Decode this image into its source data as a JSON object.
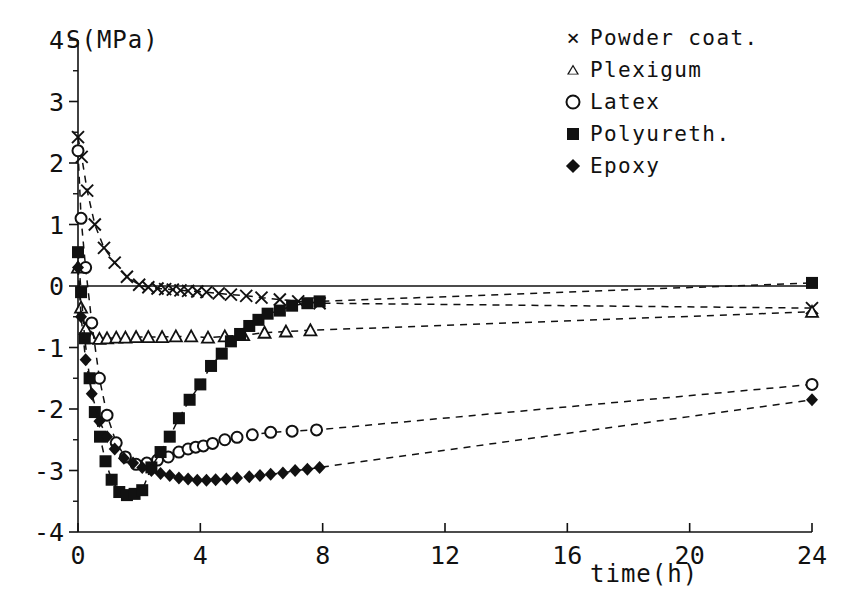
{
  "chart_data": {
    "type": "scatter",
    "title": "",
    "xlabel": "time(h)",
    "ylabel": "S(MPa)",
    "xlim": [
      0,
      24
    ],
    "ylim": [
      -4,
      4
    ],
    "xticks": [
      0,
      4,
      8,
      12,
      16,
      20,
      24
    ],
    "yticks": [
      -4,
      -3,
      -2,
      -1,
      0,
      1,
      2,
      3,
      4
    ],
    "xtick_labels": [
      "0",
      "4",
      "8",
      "12",
      "16",
      "20",
      "24"
    ],
    "ytick_labels": [
      "-4",
      "-3",
      "-2",
      "-1",
      "0",
      "1",
      "2",
      "3",
      "4"
    ],
    "grid": false,
    "legend_position": "top-right",
    "minor_ticks_y": 0.5,
    "line_style": "dashed",
    "series": [
      {
        "name": "Powder coat.",
        "marker": "x",
        "color": "#111111",
        "x": [
          0.0,
          0.12,
          0.3,
          0.55,
          0.85,
          1.2,
          1.6,
          2.0,
          2.3,
          2.6,
          2.85,
          3.1,
          3.35,
          3.6,
          3.9,
          4.2,
          4.6,
          5.0,
          5.5,
          6.0,
          6.6,
          7.2,
          7.9,
          24.0
        ],
        "y": [
          2.42,
          2.1,
          1.55,
          1.0,
          0.62,
          0.38,
          0.15,
          0.02,
          -0.02,
          -0.04,
          -0.05,
          -0.06,
          -0.07,
          -0.08,
          -0.09,
          -0.1,
          -0.12,
          -0.14,
          -0.16,
          -0.19,
          -0.22,
          -0.25,
          -0.28,
          -0.36
        ]
      },
      {
        "name": "Plexigum",
        "marker": "triangle",
        "color": "#111111",
        "x": [
          0.0,
          0.1,
          0.25,
          0.45,
          0.7,
          0.95,
          1.25,
          1.55,
          1.9,
          2.3,
          2.75,
          3.2,
          3.7,
          4.25,
          4.8,
          5.4,
          6.1,
          6.8,
          7.6,
          24.0
        ],
        "y": [
          0.3,
          -0.35,
          -0.7,
          -0.85,
          -0.86,
          -0.85,
          -0.84,
          -0.84,
          -0.83,
          -0.83,
          -0.83,
          -0.82,
          -0.82,
          -0.84,
          -0.82,
          -0.8,
          -0.76,
          -0.74,
          -0.72,
          -0.42
        ]
      },
      {
        "name": "Latex",
        "marker": "circle",
        "color": "#111111",
        "x": [
          0.0,
          0.1,
          0.25,
          0.45,
          0.7,
          0.95,
          1.25,
          1.55,
          1.9,
          2.25,
          2.6,
          2.95,
          3.3,
          3.6,
          3.85,
          4.1,
          4.4,
          4.8,
          5.2,
          5.7,
          6.3,
          7.0,
          7.8,
          24.0
        ],
        "y": [
          2.2,
          1.1,
          0.3,
          -0.6,
          -1.5,
          -2.1,
          -2.55,
          -2.78,
          -2.9,
          -2.88,
          -2.83,
          -2.78,
          -2.7,
          -2.65,
          -2.62,
          -2.6,
          -2.56,
          -2.5,
          -2.46,
          -2.42,
          -2.38,
          -2.36,
          -2.34,
          -1.6
        ]
      },
      {
        "name": "Polyureth.",
        "marker": "square",
        "color": "#111111",
        "x": [
          0.0,
          0.1,
          0.22,
          0.38,
          0.55,
          0.72,
          0.9,
          1.1,
          1.35,
          1.6,
          1.85,
          2.1,
          2.4,
          2.7,
          3.0,
          3.3,
          3.65,
          4.0,
          4.35,
          4.7,
          5.0,
          5.3,
          5.6,
          5.9,
          6.2,
          6.6,
          7.0,
          7.5,
          7.9,
          24.0
        ],
        "y": [
          0.55,
          -0.1,
          -0.85,
          -1.5,
          -2.05,
          -2.45,
          -2.85,
          -3.15,
          -3.35,
          -3.4,
          -3.38,
          -3.32,
          -2.95,
          -2.7,
          -2.45,
          -2.15,
          -1.85,
          -1.6,
          -1.3,
          -1.1,
          -0.9,
          -0.78,
          -0.65,
          -0.55,
          -0.45,
          -0.4,
          -0.32,
          -0.28,
          -0.25,
          0.05
        ]
      },
      {
        "name": "Epoxy",
        "marker": "diamond",
        "color": "#111111",
        "x": [
          0.0,
          0.1,
          0.25,
          0.45,
          0.7,
          0.95,
          1.2,
          1.5,
          1.8,
          2.1,
          2.4,
          2.7,
          3.0,
          3.3,
          3.6,
          3.9,
          4.2,
          4.5,
          4.85,
          5.2,
          5.6,
          5.95,
          6.3,
          6.7,
          7.1,
          7.5,
          7.9,
          24.0
        ],
        "y": [
          0.3,
          -0.5,
          -1.2,
          -1.75,
          -2.2,
          -2.45,
          -2.65,
          -2.8,
          -2.88,
          -2.95,
          -3.0,
          -3.05,
          -3.08,
          -3.12,
          -3.14,
          -3.16,
          -3.16,
          -3.15,
          -3.14,
          -3.12,
          -3.1,
          -3.08,
          -3.06,
          -3.04,
          -3.0,
          -2.98,
          -2.95,
          -1.85
        ]
      }
    ]
  },
  "legend": {
    "items": [
      {
        "symbol": "x-marker",
        "label": "Powder coat."
      },
      {
        "symbol": "triangle-marker",
        "label": "Plexigum"
      },
      {
        "symbol": "circle-marker",
        "label": "Latex"
      },
      {
        "symbol": "square-marker",
        "label": "Polyureth."
      },
      {
        "symbol": "diamond-marker",
        "label": "Epoxy"
      }
    ]
  },
  "axes": {
    "y_axis_title": "S(MPa)",
    "x_axis_title": "time(h)"
  }
}
